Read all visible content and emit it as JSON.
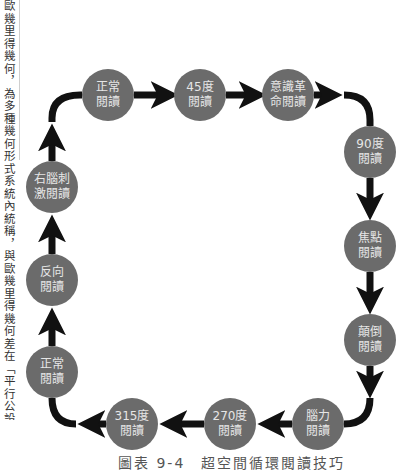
{
  "side_text": "歐幾里得幾何，為多種幾何形式系統內統稱，與歐幾里得幾何差在「平行公設」。",
  "diagram": {
    "nodes": [
      {
        "id": "n1",
        "label": "正常閱讀",
        "x": 108,
        "y": 95
      },
      {
        "id": "n2",
        "label": "45度閱讀",
        "x": 200,
        "y": 95
      },
      {
        "id": "n3",
        "label": "意識革命閱讀",
        "x": 288,
        "y": 95
      },
      {
        "id": "n4",
        "label": "90度閱讀",
        "x": 370,
        "y": 152
      },
      {
        "id": "n5",
        "label": "焦點閱讀",
        "x": 370,
        "y": 246
      },
      {
        "id": "n6",
        "label": "顛倒閱讀",
        "x": 370,
        "y": 340
      },
      {
        "id": "n7",
        "label": "腦力閱讀",
        "x": 318,
        "y": 424
      },
      {
        "id": "n8",
        "label": "270度閱讀",
        "x": 230,
        "y": 424
      },
      {
        "id": "n9",
        "label": "315度閱讀",
        "x": 132,
        "y": 424
      },
      {
        "id": "n10",
        "label": "正常閱讀",
        "x": 52,
        "y": 372
      },
      {
        "id": "n11",
        "label": "反向閱讀",
        "x": 52,
        "y": 280
      },
      {
        "id": "n12",
        "label": "右腦刺激閱讀",
        "x": 52,
        "y": 187
      }
    ],
    "node_labels": {
      "n1": [
        "正常",
        "閱讀"
      ],
      "n2": [
        "45度",
        "閱讀"
      ],
      "n3": [
        "意識革",
        "命閱讀"
      ],
      "n4": [
        "90度",
        "閱讀"
      ],
      "n5": [
        "焦點",
        "閱讀"
      ],
      "n6": [
        "顛倒",
        "閱讀"
      ],
      "n7": [
        "腦力",
        "閱讀"
      ],
      "n8": [
        "270度",
        "閱讀"
      ],
      "n9": [
        "315度",
        "閱讀"
      ],
      "n10": [
        "正常",
        "閱讀"
      ],
      "n11": [
        "反向",
        "閱讀"
      ],
      "n12": [
        "右腦刺",
        "激閱讀"
      ]
    },
    "edges": [
      [
        "n1",
        "n2"
      ],
      [
        "n2",
        "n3"
      ],
      [
        "n3",
        "n4"
      ],
      [
        "n4",
        "n5"
      ],
      [
        "n5",
        "n6"
      ],
      [
        "n6",
        "n7"
      ],
      [
        "n7",
        "n8"
      ],
      [
        "n8",
        "n9"
      ],
      [
        "n9",
        "n10"
      ],
      [
        "n10",
        "n11"
      ],
      [
        "n11",
        "n12"
      ],
      [
        "n12",
        "n1"
      ]
    ],
    "colors": {
      "node_fill": "#6b6b6b",
      "node_text": "#e6e6e6",
      "arrow": "#111111"
    }
  },
  "caption": "圖表 9-4　超空間循環閱讀技巧"
}
